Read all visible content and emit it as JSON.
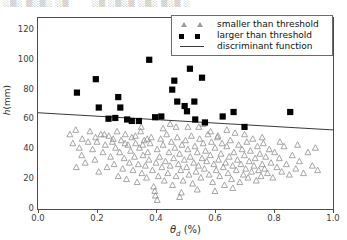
{
  "top_strip": {
    "segment_left": "░▒░ ▒░▒░ ░▒",
    "segment_right": "░▒ ░▒░▒ ░▒░ ▒░▒ ░"
  },
  "legend": {
    "position": "upper-right",
    "entries": [
      {
        "label": "smaller than threshold",
        "marker": "triangle-up-open",
        "color": "#9a9a9a",
        "icon": "triangle-marker-icon"
      },
      {
        "label": "larger than threshold",
        "marker": "square-filled",
        "color": "#000000",
        "icon": "square-marker-icon"
      },
      {
        "label": "discriminant function",
        "marker": "line",
        "color": "#3a3a3a",
        "icon": "line-marker-icon"
      }
    ]
  },
  "chart_data": {
    "type": "scatter",
    "title": "",
    "xlabel": "θ_d (%)",
    "xlabel_symbol": "θ",
    "xlabel_subscript": "d",
    "xlabel_units": "(%)",
    "ylabel": "h(mm)",
    "ylabel_symbol": "h",
    "ylabel_units": "(mm)",
    "xlim": [
      0.0,
      1.0
    ],
    "ylim": [
      0,
      128
    ],
    "xticks": [
      0.0,
      0.2,
      0.4,
      0.6,
      0.8,
      1.0
    ],
    "xticklabels": [
      "0.0",
      "0.2",
      "0.4",
      "0.6",
      "0.8",
      "1.0"
    ],
    "yticks": [
      0,
      20,
      40,
      60,
      80,
      100,
      120
    ],
    "yticklabels": [
      "0",
      "20",
      "40",
      "60",
      "80",
      "100",
      "120"
    ],
    "grid": false,
    "legend_position": "upper right",
    "series": [
      {
        "name": "larger than threshold",
        "marker": "square-filled",
        "color": "#000000",
        "points": [
          [
            0.132,
            78.0
          ],
          [
            0.196,
            87.0
          ],
          [
            0.206,
            68.0
          ],
          [
            0.239,
            60.5
          ],
          [
            0.262,
            61.0
          ],
          [
            0.272,
            75.0
          ],
          [
            0.279,
            68.0
          ],
          [
            0.302,
            60.0
          ],
          [
            0.318,
            59.0
          ],
          [
            0.342,
            59.0
          ],
          [
            0.377,
            100.0
          ],
          [
            0.397,
            61.5
          ],
          [
            0.418,
            62.0
          ],
          [
            0.455,
            80.0
          ],
          [
            0.462,
            86.0
          ],
          [
            0.472,
            72.0
          ],
          [
            0.497,
            69.0
          ],
          [
            0.505,
            65.5
          ],
          [
            0.515,
            94.0
          ],
          [
            0.53,
            72.0
          ],
          [
            0.533,
            60.0
          ],
          [
            0.556,
            88.0
          ],
          [
            0.566,
            58.0
          ],
          [
            0.626,
            62.0
          ],
          [
            0.663,
            65.0
          ],
          [
            0.7,
            55.0
          ],
          [
            0.855,
            65.0
          ]
        ]
      },
      {
        "name": "smaller than threshold",
        "marker": "triangle-up-open",
        "color": "#8f8f8f",
        "points": [
          [
            0.108,
            50.0
          ],
          [
            0.128,
            53.0
          ],
          [
            0.14,
            41.0
          ],
          [
            0.15,
            47.0
          ],
          [
            0.16,
            31.0
          ],
          [
            0.176,
            52.0
          ],
          [
            0.185,
            40.0
          ],
          [
            0.193,
            33.0
          ],
          [
            0.2,
            45.0
          ],
          [
            0.206,
            25.0
          ],
          [
            0.213,
            50.0
          ],
          [
            0.22,
            38.0
          ],
          [
            0.228,
            43.0
          ],
          [
            0.234,
            28.0
          ],
          [
            0.24,
            49.0
          ],
          [
            0.246,
            35.0
          ],
          [
            0.252,
            45.0
          ],
          [
            0.258,
            30.0
          ],
          [
            0.263,
            41.0
          ],
          [
            0.268,
            52.0
          ],
          [
            0.272,
            22.0
          ],
          [
            0.277,
            38.0
          ],
          [
            0.282,
            46.0
          ],
          [
            0.287,
            27.0
          ],
          [
            0.292,
            34.0
          ],
          [
            0.296,
            50.0
          ],
          [
            0.3,
            20.0
          ],
          [
            0.305,
            43.0
          ],
          [
            0.31,
            31.0
          ],
          [
            0.314,
            39.0
          ],
          [
            0.318,
            48.0
          ],
          [
            0.322,
            26.0
          ],
          [
            0.327,
            35.0
          ],
          [
            0.331,
            44.0
          ],
          [
            0.336,
            18.0
          ],
          [
            0.34,
            30.0
          ],
          [
            0.344,
            41.0
          ],
          [
            0.348,
            52.0
          ],
          [
            0.352,
            24.0
          ],
          [
            0.356,
            36.0
          ],
          [
            0.36,
            46.0
          ],
          [
            0.364,
            29.0
          ],
          [
            0.368,
            21.0
          ],
          [
            0.372,
            38.0
          ],
          [
            0.376,
            33.0
          ],
          [
            0.38,
            44.0
          ],
          [
            0.384,
            48.0
          ],
          [
            0.388,
            26.0
          ],
          [
            0.392,
            15.0
          ],
          [
            0.396,
            12.0
          ],
          [
            0.398,
            9.0
          ],
          [
            0.4,
            31.0
          ],
          [
            0.404,
            40.0
          ],
          [
            0.408,
            22.0
          ],
          [
            0.412,
            35.0
          ],
          [
            0.416,
            47.0
          ],
          [
            0.42,
            28.0
          ],
          [
            0.424,
            43.0
          ],
          [
            0.428,
            19.0
          ],
          [
            0.432,
            32.0
          ],
          [
            0.436,
            50.0
          ],
          [
            0.44,
            24.0
          ],
          [
            0.444,
            38.0
          ],
          [
            0.448,
            29.0
          ],
          [
            0.452,
            45.0
          ],
          [
            0.456,
            16.0
          ],
          [
            0.46,
            34.0
          ],
          [
            0.464,
            41.0
          ],
          [
            0.468,
            22.0
          ],
          [
            0.472,
            48.0
          ],
          [
            0.476,
            30.0
          ],
          [
            0.48,
            37.0
          ],
          [
            0.484,
            26.0
          ],
          [
            0.488,
            43.0
          ],
          [
            0.492,
            19.0
          ],
          [
            0.496,
            33.0
          ],
          [
            0.5,
            46.0
          ],
          [
            0.504,
            28.0
          ],
          [
            0.508,
            40.0
          ],
          [
            0.512,
            23.0
          ],
          [
            0.516,
            35.0
          ],
          [
            0.52,
            49.0
          ],
          [
            0.524,
            17.0
          ],
          [
            0.528,
            31.0
          ],
          [
            0.532,
            42.0
          ],
          [
            0.536,
            25.0
          ],
          [
            0.54,
            38.0
          ],
          [
            0.544,
            29.0
          ],
          [
            0.548,
            47.0
          ],
          [
            0.552,
            21.0
          ],
          [
            0.556,
            34.0
          ],
          [
            0.56,
            44.0
          ],
          [
            0.564,
            27.0
          ],
          [
            0.568,
            39.0
          ],
          [
            0.572,
            32.0
          ],
          [
            0.576,
            50.0
          ],
          [
            0.58,
            23.0
          ],
          [
            0.584,
            36.0
          ],
          [
            0.588,
            45.0
          ],
          [
            0.592,
            18.0
          ],
          [
            0.596,
            30.0
          ],
          [
            0.6,
            41.0
          ],
          [
            0.604,
            26.0
          ],
          [
            0.608,
            48.0
          ],
          [
            0.612,
            33.0
          ],
          [
            0.616,
            22.0
          ],
          [
            0.62,
            37.0
          ],
          [
            0.624,
            44.0
          ],
          [
            0.628,
            28.0
          ],
          [
            0.632,
            16.0
          ],
          [
            0.636,
            31.0
          ],
          [
            0.64,
            42.0
          ],
          [
            0.644,
            24.0
          ],
          [
            0.648,
            35.0
          ],
          [
            0.652,
            46.0
          ],
          [
            0.656,
            20.0
          ],
          [
            0.66,
            29.0
          ],
          [
            0.664,
            38.0
          ],
          [
            0.668,
            51.0
          ],
          [
            0.672,
            26.0
          ],
          [
            0.676,
            33.0
          ],
          [
            0.68,
            43.0
          ],
          [
            0.684,
            18.0
          ],
          [
            0.688,
            30.0
          ],
          [
            0.692,
            40.0
          ],
          [
            0.696,
            23.0
          ],
          [
            0.7,
            36.0
          ],
          [
            0.704,
            27.0
          ],
          [
            0.708,
            45.0
          ],
          [
            0.712,
            21.0
          ],
          [
            0.716,
            32.0
          ],
          [
            0.72,
            39.0
          ],
          [
            0.724,
            25.0
          ],
          [
            0.728,
            47.0
          ],
          [
            0.732,
            29.0
          ],
          [
            0.736,
            34.0
          ],
          [
            0.74,
            19.0
          ],
          [
            0.744,
            42.0
          ],
          [
            0.748,
            26.0
          ],
          [
            0.752,
            37.0
          ],
          [
            0.756,
            22.0
          ],
          [
            0.76,
            30.0
          ],
          [
            0.764,
            44.0
          ],
          [
            0.768,
            27.0
          ],
          [
            0.772,
            35.0
          ],
          [
            0.778,
            24.0
          ],
          [
            0.784,
            40.0
          ],
          [
            0.79,
            31.0
          ],
          [
            0.796,
            21.0
          ],
          [
            0.802,
            38.0
          ],
          [
            0.81,
            28.0
          ],
          [
            0.818,
            34.0
          ],
          [
            0.826,
            25.0
          ],
          [
            0.834,
            42.0
          ],
          [
            0.842,
            30.0
          ],
          [
            0.852,
            23.0
          ],
          [
            0.862,
            36.0
          ],
          [
            0.874,
            27.0
          ],
          [
            0.886,
            32.0
          ],
          [
            0.9,
            24.0
          ],
          [
            0.915,
            38.0
          ],
          [
            0.93,
            29.0
          ],
          [
            0.948,
            26.0
          ],
          [
            0.37,
            47.0
          ],
          [
            0.355,
            43.0
          ],
          [
            0.33,
            49.0
          ],
          [
            0.295,
            44.0
          ],
          [
            0.255,
            47.0
          ],
          [
            0.225,
            50.0
          ],
          [
            0.195,
            48.0
          ],
          [
            0.17,
            45.0
          ],
          [
            0.148,
            36.0
          ],
          [
            0.13,
            28.0
          ],
          [
            0.118,
            44.0
          ],
          [
            0.545,
            55.0
          ],
          [
            0.585,
            52.0
          ],
          [
            0.468,
            55.0
          ],
          [
            0.424,
            54.0
          ],
          [
            0.35,
            55.0
          ],
          [
            0.64,
            53.0
          ],
          [
            0.7,
            50.0
          ],
          [
            0.76,
            48.0
          ],
          [
            0.82,
            45.0
          ],
          [
            0.88,
            43.0
          ],
          [
            0.94,
            41.0
          ],
          [
            0.48,
            8.0
          ],
          [
            0.486,
            11.0
          ],
          [
            0.404,
            6.0
          ],
          [
            0.6,
            12.0
          ],
          [
            0.66,
            14.0
          ],
          [
            0.54,
            13.0
          ],
          [
            0.508,
            55.0
          ],
          [
            0.56,
            57.0
          ],
          [
            0.61,
            49.0
          ],
          [
            0.448,
            57.0
          ]
        ]
      }
    ],
    "discriminant_function": {
      "name": "discriminant function",
      "color": "#3a3a3a",
      "x_start": 0.0,
      "y_start": 64.5,
      "x_end": 1.0,
      "y_end": 53.0
    }
  }
}
